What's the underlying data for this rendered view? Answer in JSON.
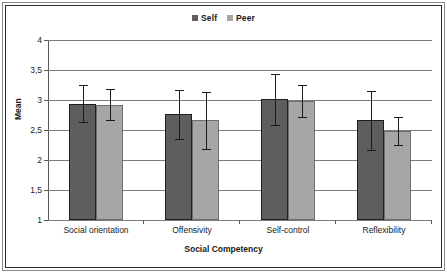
{
  "chart_data": {
    "type": "bar",
    "title": "",
    "xlabel": "Social Competency",
    "ylabel": "Mean",
    "ylim": [
      1,
      4
    ],
    "ytick_labels": [
      "4",
      "3,5",
      "3",
      "2,5",
      "2",
      "1,5",
      "1"
    ],
    "ytick_values": [
      4,
      3.5,
      3,
      2.5,
      2,
      1.5,
      1
    ],
    "grid": true,
    "legend_position": "top-center",
    "categories": [
      "Social orientation",
      "Offensivity",
      "Self-control",
      "Reflexibility"
    ],
    "series": [
      {
        "name": "Self",
        "color": "#5e5e5e",
        "values": [
          2.94,
          2.76,
          3.01,
          2.66
        ],
        "errors": [
          0.31,
          0.41,
          0.42,
          0.49
        ]
      },
      {
        "name": "Peer",
        "color": "#a6a6a6",
        "values": [
          2.92,
          2.66,
          2.98,
          2.48
        ],
        "errors": [
          0.26,
          0.48,
          0.27,
          0.23
        ]
      }
    ]
  },
  "legend": {
    "items": [
      {
        "label": "Self",
        "color": "#5e5e5e"
      },
      {
        "label": "Peer",
        "color": "#a6a6a6"
      }
    ]
  },
  "axes": {
    "y_title": "Mean",
    "x_title": "Social Competency"
  }
}
